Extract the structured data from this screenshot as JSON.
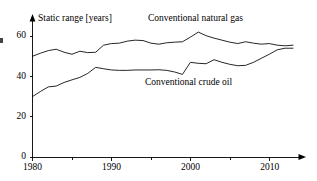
{
  "chart_data": {
    "type": "line",
    "title": "Static range [years]",
    "xlabel": "",
    "ylabel": "Static range [years]",
    "xlim": [
      1980,
      2013
    ],
    "ylim": [
      0,
      68
    ],
    "yticks": [
      0,
      20,
      40,
      60
    ],
    "ytick_labels": [
      "0",
      "20",
      "40",
      "60"
    ],
    "xticks": [
      1980,
      1990,
      2000,
      2010
    ],
    "xtick_labels": [
      "1980",
      "1990",
      "2000",
      "2010"
    ],
    "x_minor_ticks": [
      1985,
      1995,
      2005
    ],
    "grid": false,
    "legend": "inline-labels",
    "annotations": [
      {
        "name": "natural-gas-label",
        "text": "Conventional natural gas",
        "x": 1992.5,
        "y": 66
      },
      {
        "name": "crude-oil-label",
        "text": "Conventional crude oil",
        "x": 1997.0,
        "y": 36
      }
    ],
    "x": [
      1980,
      1981,
      1982,
      1983,
      1984,
      1985,
      1986,
      1987,
      1988,
      1989,
      1990,
      1991,
      1992,
      1993,
      1994,
      1995,
      1996,
      1997,
      1998,
      1999,
      2000,
      2001,
      2002,
      2003,
      2004,
      2005,
      2006,
      2007,
      2008,
      2009,
      2010,
      2011,
      2012,
      2013
    ],
    "series": [
      {
        "name": "Conventional natural gas",
        "values": [
          50.0,
          51.5,
          52.8,
          53.5,
          52.0,
          51.0,
          52.5,
          51.8,
          52.0,
          55.5,
          56.3,
          56.5,
          57.5,
          58.0,
          57.8,
          56.5,
          56.0,
          56.7,
          57.0,
          57.2,
          59.5,
          62.0,
          60.2,
          59.0,
          58.0,
          57.0,
          56.3,
          57.2,
          56.5,
          56.0,
          56.3,
          55.5,
          55.2,
          55.5
        ]
      },
      {
        "name": "Conventional crude oil",
        "values": [
          30.0,
          32.5,
          34.8,
          35.2,
          37.0,
          38.3,
          39.5,
          41.5,
          44.5,
          43.8,
          43.2,
          43.0,
          43.0,
          43.2,
          43.2,
          43.2,
          43.3,
          43.0,
          42.2,
          41.0,
          47.0,
          46.5,
          46.3,
          48.3,
          47.0,
          46.0,
          45.3,
          45.5,
          47.0,
          49.0,
          51.0,
          53.2,
          54.0,
          54.0
        ]
      }
    ]
  },
  "colors": {
    "background": "#ffffff",
    "line": "#000000",
    "axis": "#000000"
  }
}
